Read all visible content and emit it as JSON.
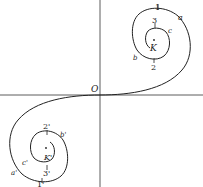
{
  "figure": {
    "origin_label": "O",
    "upper_spiral": {
      "center_label": "K",
      "points": {
        "p1": "1",
        "p2": "2",
        "p3": "3",
        "a": "a",
        "b": "b",
        "c": "c"
      }
    },
    "lower_spiral": {
      "center_label": "K'",
      "points": {
        "p1": "1'",
        "p2": "2'",
        "p3": "3'",
        "a": "a'",
        "b": "b'",
        "c": "c'"
      }
    },
    "colors": {
      "line": "#222222",
      "background": "#ffffff"
    }
  }
}
